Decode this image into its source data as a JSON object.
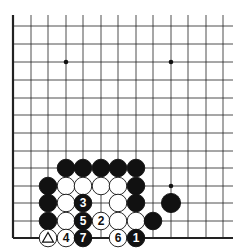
{
  "diagram": {
    "type": "go-board-fragment",
    "colors": {
      "background": "#ffffff",
      "line": "#222222",
      "black": "#111111",
      "white": "#ffffff"
    },
    "grid": {
      "x": [
        13,
        31,
        48,
        66,
        83,
        101,
        118,
        136,
        153,
        171,
        188,
        206,
        223
      ],
      "y": [
        26,
        44,
        62,
        80,
        98,
        115,
        133,
        151,
        168,
        186,
        203,
        221,
        238
      ],
      "line_extent": {
        "x_max": 233,
        "y_min": 15
      },
      "edges": [
        "left",
        "bottom"
      ]
    },
    "hoshi": [
      {
        "col": 3,
        "row": 2
      },
      {
        "col": 9,
        "row": 2
      },
      {
        "col": 9,
        "row": 9
      }
    ],
    "stones": [
      {
        "col": 3,
        "row": 8,
        "color": "black",
        "label": ""
      },
      {
        "col": 4,
        "row": 8,
        "color": "black",
        "label": ""
      },
      {
        "col": 5,
        "row": 8,
        "color": "black",
        "label": ""
      },
      {
        "col": 6,
        "row": 8,
        "color": "black",
        "label": ""
      },
      {
        "col": 7,
        "row": 8,
        "color": "black",
        "label": ""
      },
      {
        "col": 2,
        "row": 9,
        "color": "black",
        "label": ""
      },
      {
        "col": 3,
        "row": 9,
        "color": "white",
        "label": ""
      },
      {
        "col": 4,
        "row": 9,
        "color": "white",
        "label": ""
      },
      {
        "col": 5,
        "row": 9,
        "color": "white",
        "label": ""
      },
      {
        "col": 6,
        "row": 9,
        "color": "white",
        "label": ""
      },
      {
        "col": 7,
        "row": 9,
        "color": "black",
        "label": ""
      },
      {
        "col": 2,
        "row": 10,
        "color": "black",
        "label": ""
      },
      {
        "col": 3,
        "row": 10,
        "color": "white",
        "label": ""
      },
      {
        "col": 4,
        "row": 10,
        "color": "black",
        "label": "3"
      },
      {
        "col": 6,
        "row": 10,
        "color": "white",
        "label": ""
      },
      {
        "col": 7,
        "row": 10,
        "color": "black",
        "label": ""
      },
      {
        "col": 9,
        "row": 10,
        "color": "black",
        "label": ""
      },
      {
        "col": 2,
        "row": 11,
        "color": "black",
        "label": ""
      },
      {
        "col": 3,
        "row": 11,
        "color": "white",
        "label": ""
      },
      {
        "col": 4,
        "row": 11,
        "color": "black",
        "label": "5"
      },
      {
        "col": 5,
        "row": 11,
        "color": "white",
        "label": "2"
      },
      {
        "col": 6,
        "row": 11,
        "color": "white",
        "label": ""
      },
      {
        "col": 7,
        "row": 11,
        "color": "white",
        "label": ""
      },
      {
        "col": 8,
        "row": 11,
        "color": "black",
        "label": ""
      },
      {
        "col": 2,
        "row": 12,
        "color": "white",
        "label": "triangle"
      },
      {
        "col": 3,
        "row": 12,
        "color": "white",
        "label": "4"
      },
      {
        "col": 4,
        "row": 12,
        "color": "black",
        "label": "7"
      },
      {
        "col": 6,
        "row": 12,
        "color": "white",
        "label": "6"
      },
      {
        "col": 7,
        "row": 12,
        "color": "black",
        "label": "1"
      }
    ]
  }
}
